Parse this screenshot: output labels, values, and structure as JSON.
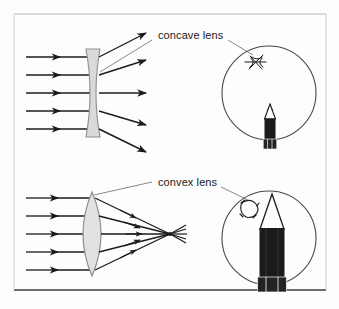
{
  "figure": {
    "background_color": "#fdfdfd",
    "border_color": "#6e6e6e",
    "ink_color": "#1b1b1b",
    "lens_fill_color": "#d9d9d9",
    "lens_stroke_color": "#8a8a8a",
    "width": 339,
    "height": 309
  },
  "labels": {
    "concave": "concave lens",
    "convex": "convex lens"
  },
  "panels": [
    {
      "id": "concave",
      "label": "concave lens",
      "lens_type": "biconcave",
      "ray_behaviour": "diverging",
      "incoming_ray_count": 5,
      "outgoing_ray_count": 5,
      "view_circle": {
        "image_effect": "reduced",
        "pencil_size": "small",
        "sketch_shape": "star"
      }
    },
    {
      "id": "convex",
      "label": "convex lens",
      "lens_type": "biconvex",
      "ray_behaviour": "converging",
      "incoming_ray_count": 5,
      "outgoing_ray_count": 5,
      "focal_point": true,
      "view_circle": {
        "image_effect": "magnified",
        "pencil_size": "large",
        "sketch_shape": "rounded-square"
      }
    }
  ],
  "pencil": {
    "tip_color": "#1b1b1b",
    "wood_color": "#fdfdfd",
    "barrel_color": "#1b1b1b",
    "ferrule_color": "#2a2a2a"
  }
}
